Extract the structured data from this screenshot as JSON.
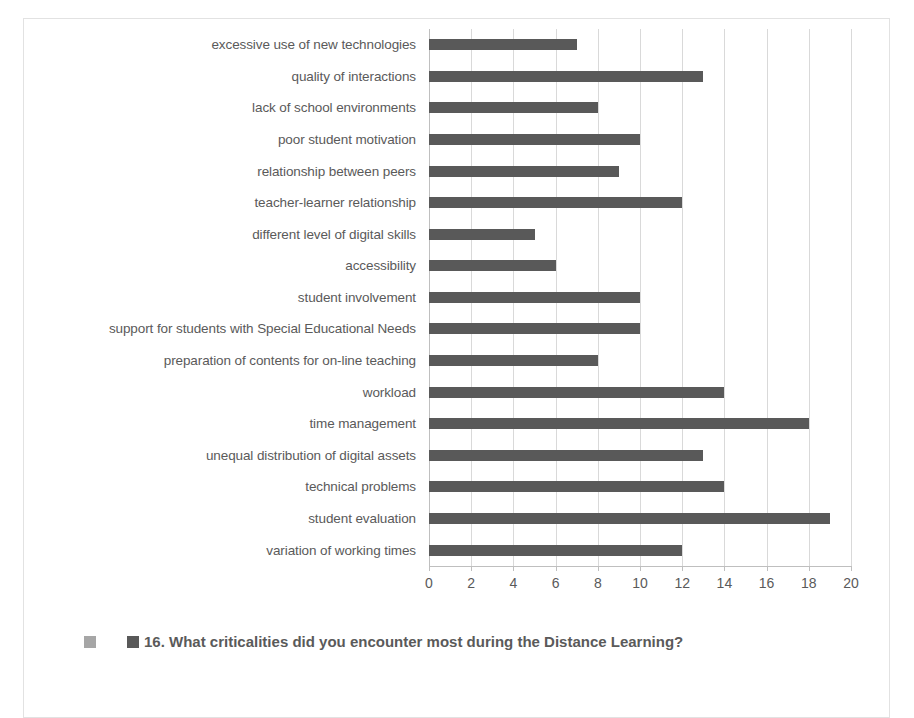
{
  "chart_data": {
    "type": "bar",
    "orientation": "horizontal",
    "title": "16. What criticalities did you encounter most during the Distance Learning?",
    "xlabel": "",
    "ylabel": "",
    "xlim": [
      0,
      20
    ],
    "xticks": [
      0,
      2,
      4,
      6,
      8,
      10,
      12,
      14,
      16,
      18,
      20
    ],
    "xtick_labels": [
      "0",
      "2",
      "4",
      "6",
      "8",
      "10",
      "12",
      "14",
      "16",
      "18",
      "20"
    ],
    "grid": "vertical",
    "legend_position": "bottom",
    "categories": [
      "excessive use of new technologies",
      "quality of interactions",
      "lack of school environments",
      "poor student motivation",
      "relationship between peers",
      "teacher-learner relationship",
      "different level of digital skills",
      "accessibility",
      "student involvement",
      "support for students with Special Educational Needs",
      "preparation of contents for on-line teaching",
      "workload",
      "time management",
      "unequal distribution of digital assets",
      "technical problems",
      "student evaluation",
      "variation of working times"
    ],
    "values": [
      7,
      13,
      8,
      10,
      9,
      12,
      5,
      6,
      10,
      10,
      8,
      14,
      18,
      13,
      14,
      19,
      12
    ],
    "series": [
      {
        "name": "16. What criticalities did you encounter most during the Distance Learning?",
        "values": [
          7,
          13,
          8,
          10,
          9,
          12,
          5,
          6,
          10,
          10,
          8,
          14,
          18,
          13,
          14,
          19,
          12
        ],
        "color": "#595959"
      }
    ],
    "colors": {
      "bar": "#595959",
      "legend_swatch_light": "#a6a6a6",
      "legend_swatch_dark": "#595959",
      "gridline": "#d9d9d9",
      "axis": "#bfbfbf",
      "text": "#5a5a5a",
      "frame_border": "#e2e2e2",
      "background": "#ffffff"
    }
  },
  "legend": {
    "label": "16. What criticalities did you encounter most during the Distance Learning?"
  }
}
